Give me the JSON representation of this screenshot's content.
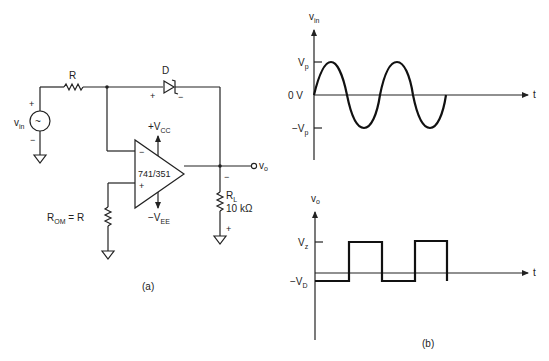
{
  "circuit": {
    "caption": "(a)",
    "source": {
      "label": "v",
      "label_sub": "in",
      "plus": "+",
      "minus": "−",
      "symbol": "~"
    },
    "input_resistor": {
      "label": "R"
    },
    "diode": {
      "label": "D",
      "plus": "+",
      "minus": "−"
    },
    "opamp": {
      "label": "741/351",
      "inverting": "−",
      "noninverting": "+",
      "vcc": "+V",
      "vcc_sub": "CC",
      "vee": "−V",
      "vee_sub": "EE"
    },
    "offset_resistor": {
      "label": "R",
      "label_sub": "OM",
      "suffix": " = R"
    },
    "load_resistor": {
      "label": "R",
      "label_sub": "L",
      "value": "10 kΩ",
      "top_sign": "−",
      "bottom_sign": "+"
    },
    "output": {
      "label": "v",
      "label_sub": "o"
    }
  },
  "waveforms": {
    "caption": "(b)",
    "input": {
      "ylabel": "v",
      "ylabel_sub": "in",
      "xlabel": "t",
      "tick_vp": "V",
      "tick_vp_sub": "p",
      "tick_zero": "0 V",
      "tick_neg_vp": "−V",
      "tick_neg_vp_sub": "p"
    },
    "output": {
      "ylabel": "v",
      "ylabel_sub": "o",
      "xlabel": "t",
      "tick_vz": "V",
      "tick_vz_sub": "z",
      "tick_neg_vd": "−V",
      "tick_neg_vd_sub": "D"
    }
  }
}
